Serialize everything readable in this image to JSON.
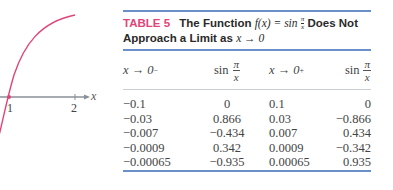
{
  "graph": {
    "curve_color": "#e0457a",
    "axis_color": "#8a8f98",
    "axis_label": "x",
    "ticks": [
      "1",
      "2"
    ]
  },
  "table": {
    "label": "TABLE 5",
    "title_text_1": "The Function",
    "title_math": "f(x) = sin",
    "title_frac_num": "π",
    "title_frac_den": "x",
    "title_text_2": "Does Not",
    "title_line2_text": "Approach a Limit as",
    "title_line2_math": "x → 0",
    "accent_color": "#e0457a",
    "rule_color": "#6b8fc9",
    "headers": [
      {
        "pre": "x → 0",
        "sup": "−"
      },
      {
        "fn": "sin",
        "num": "π",
        "den": "x"
      },
      {
        "pre": "x → 0",
        "sup": "+"
      },
      {
        "fn": "sin",
        "num": "π",
        "den": "x"
      }
    ],
    "rows": [
      [
        "−0.1",
        "0",
        "0.1",
        "0"
      ],
      [
        "−0.03",
        "0.866",
        "0.03",
        "−0.866"
      ],
      [
        "−0.007",
        "−0.434",
        "0.007",
        "0.434"
      ],
      [
        "−0.0009",
        "0.342",
        "0.0009",
        "−0.342"
      ],
      [
        "−0.00065",
        "−0.935",
        "0.00065",
        "0.935"
      ]
    ]
  }
}
